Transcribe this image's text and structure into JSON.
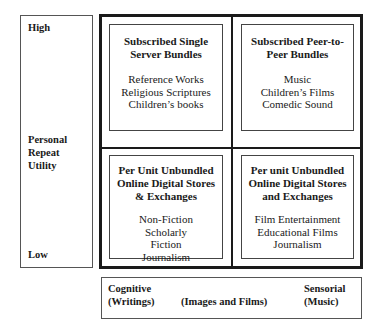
{
  "y_axis": {
    "high": "High",
    "label_lines": [
      "Personal",
      "Repeat",
      "Utility"
    ],
    "low": "Low"
  },
  "quadrants": {
    "top_left": {
      "title_lines": [
        "Subscribed Single",
        "Server Bundles"
      ],
      "items": [
        "Reference Works",
        "Religious Scriptures",
        "Children’s books"
      ]
    },
    "top_right": {
      "title_lines": [
        "Subscribed Peer-to-",
        "Peer Bundles"
      ],
      "items": [
        "Music",
        "Children’s Films",
        "Comedic Sound"
      ]
    },
    "bottom_left": {
      "title_lines": [
        "Per Unit Unbundled",
        "Online Digital Stores",
        "& Exchanges"
      ],
      "items": [
        "Non-Fiction",
        "Scholarly",
        "Fiction",
        "Journalism"
      ]
    },
    "bottom_right": {
      "title_lines": [
        "Per unit Unbundled",
        "Online Digital Stores",
        "and Exchanges"
      ],
      "items": [
        "Film Entertainment",
        "Educational Films",
        "Journalism"
      ]
    }
  },
  "x_axis": {
    "left_line1": "Cognitive",
    "left_line2": "(Writings)",
    "middle": "(Images and Films)",
    "right_line1": "Sensorial",
    "right_line2": "(Music)"
  }
}
